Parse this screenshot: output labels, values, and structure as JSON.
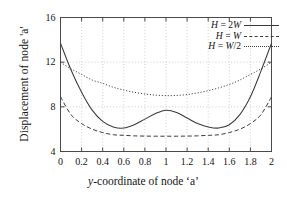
{
  "chart_data": {
    "type": "line",
    "title": "",
    "xlabel": "y-coordinate of node 'a'",
    "ylabel": "Displacement of node 'a'",
    "xlim": [
      0,
      2
    ],
    "ylim": [
      4,
      16
    ],
    "xticks": [
      "0",
      "0.2",
      "0.4",
      "0.6",
      "0.8",
      "1",
      "1.2",
      "1.4",
      "1.6",
      "1.8",
      "2"
    ],
    "xtick_values": [
      0,
      0.2,
      0.4,
      0.6,
      0.8,
      1,
      1.2,
      1.4,
      1.6,
      1.8,
      2
    ],
    "yticks": [
      "4",
      "8",
      "12",
      "16"
    ],
    "ytick_values": [
      4,
      8,
      12,
      16
    ],
    "grid": true,
    "grid_color": "#b9b9b9",
    "legend_position": "top-right",
    "line_color": "#3a3a3a",
    "x": [
      0,
      0.1,
      0.2,
      0.3,
      0.4,
      0.5,
      0.6,
      0.7,
      0.8,
      0.9,
      1.0,
      1.1,
      1.2,
      1.3,
      1.4,
      1.5,
      1.6,
      1.7,
      1.8,
      1.9,
      2.0
    ],
    "series": [
      {
        "name": "H = 2W",
        "style": "solid",
        "values": [
          13.7,
          11.3,
          9.3,
          7.7,
          6.7,
          6.2,
          6.1,
          6.4,
          6.9,
          7.4,
          7.7,
          7.5,
          7.0,
          6.5,
          6.2,
          6.1,
          6.4,
          7.3,
          8.9,
          11.2,
          13.7
        ]
      },
      {
        "name": "H = W",
        "style": "dashed",
        "values": [
          8.9,
          7.3,
          6.5,
          6.0,
          5.7,
          5.5,
          5.45,
          5.4,
          5.38,
          5.37,
          5.37,
          5.37,
          5.38,
          5.4,
          5.45,
          5.5,
          5.7,
          6.0,
          6.5,
          7.3,
          8.9
        ]
      },
      {
        "name": "H = W/2",
        "style": "dotted",
        "values": [
          12.0,
          11.4,
          10.9,
          10.4,
          10.1,
          9.75,
          9.5,
          9.3,
          9.15,
          9.05,
          9.0,
          9.02,
          9.1,
          9.25,
          9.45,
          9.7,
          10.0,
          10.4,
          10.9,
          11.4,
          12.0
        ]
      }
    ],
    "legend": [
      {
        "label_html": "H = 2W",
        "style": "solid"
      },
      {
        "label_html": "H = W",
        "style": "dashed"
      },
      {
        "label_html": "H = W/2",
        "style": "dotted"
      }
    ]
  }
}
